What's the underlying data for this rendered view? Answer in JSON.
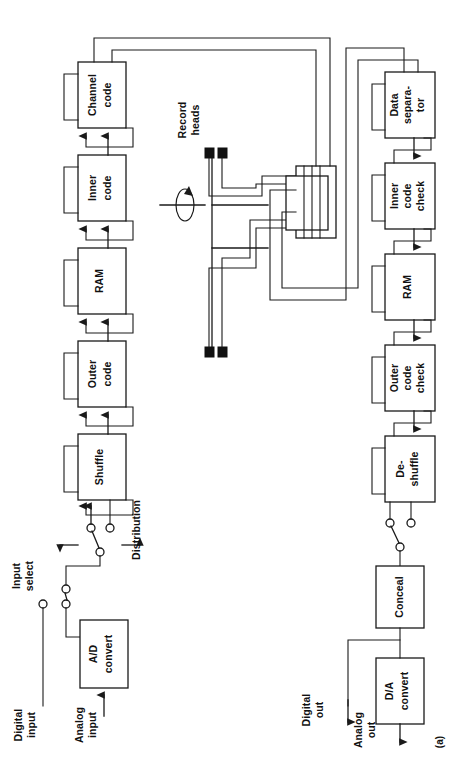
{
  "figure": {
    "caption": "(a)",
    "orientation_note": "rotated-90-ccw",
    "ink_color": "#1a1a1a",
    "background": "#ffffff"
  },
  "record_chain": {
    "title": "record-signal-path",
    "blocks": [
      {
        "id": "shuffle",
        "label": "Shuffle"
      },
      {
        "id": "outer-code",
        "label": "Outer\ncode",
        "line1": "Outer",
        "line2": "code"
      },
      {
        "id": "ram-record",
        "label": "RAM"
      },
      {
        "id": "inner-code",
        "label": "Inner\ncode",
        "line1": "Inner",
        "line2": "code"
      },
      {
        "id": "channel-code",
        "label": "Channel\ncode",
        "line1": "Channel",
        "line2": "code"
      }
    ]
  },
  "playback_chain": {
    "title": "playback-signal-path",
    "blocks": [
      {
        "id": "data-separator",
        "label": "Data separa-tor",
        "line1": "Data",
        "line2": "separa-",
        "line3": "tor"
      },
      {
        "id": "inner-code-check",
        "label": "Inner code check",
        "line1": "Inner",
        "line2": "code",
        "line3": "check"
      },
      {
        "id": "ram-playback",
        "label": "RAM"
      },
      {
        "id": "outer-code-check",
        "label": "Outer code check",
        "line1": "Outer",
        "line2": "code",
        "line3": "check"
      },
      {
        "id": "de-shuffle",
        "label": "De-shuffle",
        "line1": "De-",
        "line2": "shuffle"
      }
    ]
  },
  "converters": {
    "ad": {
      "id": "ad-convert",
      "line1": "A/D",
      "line2": "convert"
    },
    "da": {
      "id": "da-convert",
      "line1": "D/A",
      "line2": "convert"
    },
    "conceal": {
      "id": "conceal",
      "label": "Conceal"
    }
  },
  "heads": {
    "label_line1": "Record",
    "label_line2": "heads",
    "rotation_indicator": "rotation-arrow",
    "head_count": 4
  },
  "switches": {
    "input_select": {
      "line1": "Input",
      "line2": "select"
    },
    "distribution": {
      "label": "Distribution"
    }
  },
  "io_labels": {
    "digital_input": {
      "line1": "Digital",
      "line2": "input"
    },
    "analog_input": {
      "line1": "Analog",
      "line2": "input"
    },
    "digital_output": {
      "line1": "Digital",
      "line2": "out"
    },
    "analog_output": {
      "line1": "Analog",
      "line2": "out"
    }
  }
}
